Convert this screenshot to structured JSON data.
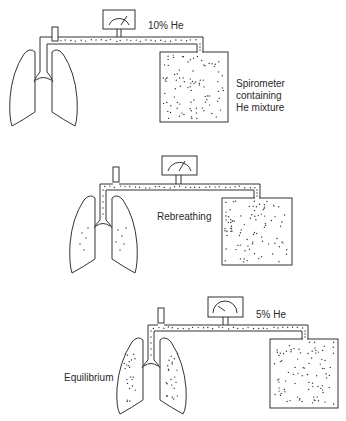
{
  "panels": [
    {
      "name": "initial",
      "gauge_label": "10% He",
      "spirometer_label": [
        "Spirometer",
        "containing",
        "He mixture"
      ],
      "lung_dots": false
    },
    {
      "name": "rebreathing",
      "state_label": "Rebreathing",
      "lung_dots": "few"
    },
    {
      "name": "equilibrium",
      "gauge_label": "5% He",
      "state_label": "Equilibrium",
      "lung_dots": "many"
    }
  ],
  "colors": {
    "line": "#333333",
    "background": "#ffffff"
  }
}
